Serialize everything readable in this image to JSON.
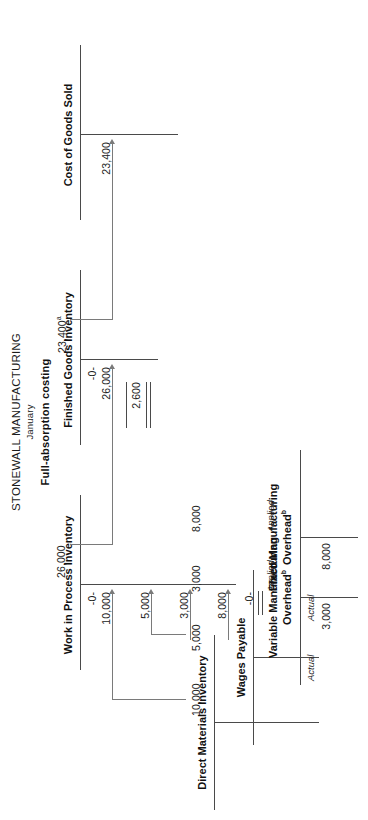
{
  "header": {
    "company": "STONEWALL MANUFACTURING",
    "period": "January",
    "method": "Full-absorption costing"
  },
  "accounts": {
    "direct_materials": {
      "title": "Direct Materials Inventory",
      "credit_amount": "10,000"
    },
    "wages_payable": {
      "title": "Wages Payable",
      "credit_amount": "5,000"
    },
    "variable_overhead": {
      "title": "Variable Manufacturing",
      "title2": "Overhead",
      "title_sup": "b",
      "debit_label": "Actual",
      "debit_amount": "3,000",
      "credit_label": "Applied",
      "credit_amount": "3,000"
    },
    "fixed_overhead": {
      "title": "Fixed Manufacturing",
      "title2": "Overhead",
      "title_sup": "b",
      "debit_label": "Actual",
      "debit_amount": "8,000",
      "credit_label": "Applied",
      "credit_amount": "8,000"
    },
    "work_in_process": {
      "title": "Work in Process Inventory",
      "beginning_balance": "-0-",
      "debit_materials": "10,000",
      "debit_labor": "5,000",
      "debit_variable_oh": "3,000",
      "debit_fixed_oh": "8,000",
      "credit_transferred_out": "26,000",
      "ending_balance": "-0-"
    },
    "finished_goods": {
      "title": "Finished Goods Inventory",
      "beginning_balance": "-0-",
      "debit_transferred_in": "26,000",
      "credit_cogs": "23,400",
      "credit_cogs_sup": "a",
      "ending_balance": "2,600"
    },
    "cost_of_goods_sold": {
      "title": "Cost of Goods Sold",
      "debit_amount": "23,400"
    }
  },
  "colors": {
    "rule": "#4a4a4a",
    "arrow": "#7a7a7a",
    "text": "#1a1a1a"
  }
}
